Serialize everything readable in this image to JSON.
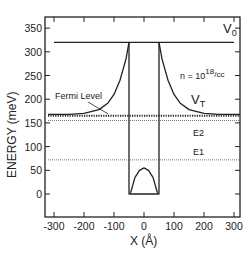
{
  "chart_data": {
    "type": "line",
    "title": "",
    "xlabel": "X (Å)",
    "ylabel": "ENERGY (meV)",
    "xlim": [
      -320,
      320
    ],
    "ylim": [
      -50,
      375
    ],
    "xticks": [
      -300,
      -200,
      -100,
      0,
      100,
      200,
      300
    ],
    "yticks": [
      0,
      50,
      100,
      150,
      200,
      250,
      300,
      350
    ],
    "grid": false,
    "series": [
      {
        "name": "V0",
        "style": "solid",
        "segments": [
          {
            "x": [
              -300,
              -50
            ],
            "y": [
              320,
              320
            ]
          },
          {
            "x": [
              50,
              300
            ],
            "y": [
              320,
              320
            ]
          }
        ]
      },
      {
        "name": "VT",
        "style": "solid",
        "x": [
          -320,
          -250,
          -200,
          -150,
          -120,
          -100,
          -80,
          -60,
          -50,
          50,
          60,
          80,
          100,
          120,
          150,
          200,
          250,
          320
        ],
        "y": [
          168,
          168,
          170,
          178,
          192,
          210,
          240,
          285,
          320,
          320,
          285,
          240,
          210,
          192,
          178,
          170,
          168,
          168
        ]
      },
      {
        "name": "Well",
        "style": "solid",
        "x": [
          -50,
          -50,
          50,
          50
        ],
        "y": [
          320,
          0,
          0,
          320
        ]
      },
      {
        "name": "Hartree bump",
        "style": "solid",
        "x": [
          -45,
          -30,
          -15,
          0,
          15,
          30,
          45
        ],
        "y": [
          2,
          35,
          50,
          55,
          50,
          35,
          2
        ]
      },
      {
        "name": "Fermi Level",
        "style": "dotted-thick",
        "x": [
          -320,
          320
        ],
        "y": [
          165,
          165
        ]
      },
      {
        "name": "E2",
        "style": "dotted",
        "x": [
          -320,
          320
        ],
        "y": [
          155,
          155
        ]
      },
      {
        "name": "E1",
        "style": "dotted",
        "x": [
          -320,
          320
        ],
        "y": [
          72,
          72
        ]
      }
    ],
    "annotations": [
      {
        "text": "V",
        "sub": "0",
        "x": 245,
        "y": 340
      },
      {
        "text": "n = 10",
        "sup": "18",
        "tail": "/cc",
        "x": 170,
        "y": 265
      },
      {
        "text": "Fermi Level",
        "x": -220,
        "y": 200,
        "arrow_to": [
          -120,
          167
        ]
      },
      {
        "text": "V",
        "sub": "T",
        "x": 185,
        "y": 185
      },
      {
        "text": "E2",
        "x": 185,
        "y": 130
      },
      {
        "text": "E1",
        "x": 190,
        "y": 88
      }
    ]
  },
  "labels": {
    "xlabel": "X (Å)",
    "ylabel": "ENERGY (meV)",
    "v0": "V",
    "v0_sub": "0",
    "vt": "V",
    "vt_sub": "T",
    "density_prefix": "n = 10",
    "density_exp": "18",
    "density_unit": "/cc",
    "fermi": "Fermi Level",
    "e1": "E1",
    "e2": "E2"
  }
}
